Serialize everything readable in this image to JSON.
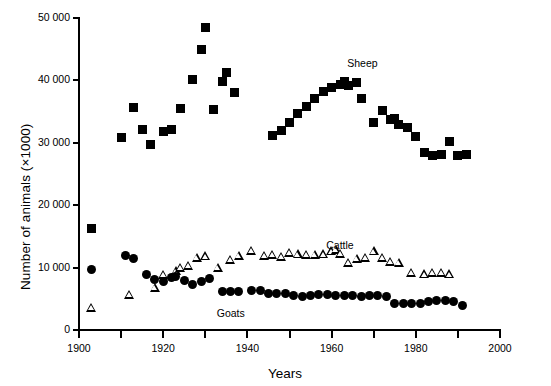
{
  "chart_data": {
    "type": "scatter",
    "title": "",
    "xlabel": "Years",
    "ylabel": "Number of animals (×1000)",
    "xlim": [
      1900,
      2000
    ],
    "ylim": [
      0,
      50000
    ],
    "xticks": [
      1900,
      1910,
      1920,
      1930,
      1940,
      1950,
      1960,
      1970,
      1980,
      1990,
      2000
    ],
    "xticklabels": [
      "1900",
      "1910",
      "1920",
      "1930",
      "1940",
      "1950",
      "1960",
      "1970",
      "1980",
      "1990",
      "2000"
    ],
    "xticklabels_shown": [
      "1900",
      "1920",
      "1940",
      "1960",
      "1980",
      "2000"
    ],
    "yticks": [
      0,
      10000,
      20000,
      30000,
      40000,
      50000
    ],
    "yticklabels": [
      "0",
      "10 000",
      "20 000",
      "30 000",
      "40 000",
      "50 000"
    ],
    "grid": false,
    "legend": "inline-annotations",
    "series": [
      {
        "name": "Sheep",
        "marker": "filled-square",
        "color": "#000000",
        "label_x": 1968,
        "label_y": 42600,
        "points": [
          [
            1903,
            16200
          ],
          [
            1910,
            30800
          ],
          [
            1913,
            35700
          ],
          [
            1915,
            32100
          ],
          [
            1917,
            29800
          ],
          [
            1920,
            31800
          ],
          [
            1922,
            32200
          ],
          [
            1924,
            35500
          ],
          [
            1927,
            40200
          ],
          [
            1929,
            44900
          ],
          [
            1930,
            48500
          ],
          [
            1932,
            35400
          ],
          [
            1934,
            39900
          ],
          [
            1935,
            41300
          ],
          [
            1937,
            38100
          ],
          [
            1946,
            31200
          ],
          [
            1948,
            32000
          ],
          [
            1950,
            33300
          ],
          [
            1952,
            34700
          ],
          [
            1954,
            35800
          ],
          [
            1956,
            37100
          ],
          [
            1958,
            38300
          ],
          [
            1960,
            38900
          ],
          [
            1962,
            39400
          ],
          [
            1963,
            39900
          ],
          [
            1964,
            39200
          ],
          [
            1966,
            39600
          ],
          [
            1967,
            37100
          ],
          [
            1970,
            33300
          ],
          [
            1972,
            35100
          ],
          [
            1974,
            33800
          ],
          [
            1975,
            33900
          ],
          [
            1976,
            32900
          ],
          [
            1978,
            32400
          ],
          [
            1980,
            31000
          ],
          [
            1982,
            28500
          ],
          [
            1984,
            27900
          ],
          [
            1986,
            28100
          ],
          [
            1988,
            30200
          ],
          [
            1990,
            27900
          ],
          [
            1992,
            28200
          ]
        ]
      },
      {
        "name": "Cattle",
        "marker": "open-triangle",
        "color": "#000000",
        "label_x": 1963,
        "label_y": 13400,
        "points": [
          [
            1903,
            3600
          ],
          [
            1912,
            5600
          ],
          [
            1918,
            6700
          ],
          [
            1920,
            8800
          ],
          [
            1923,
            9400
          ],
          [
            1924,
            10000
          ],
          [
            1926,
            10300
          ],
          [
            1928,
            11500
          ],
          [
            1930,
            11800
          ],
          [
            1933,
            10000
          ],
          [
            1936,
            11200
          ],
          [
            1938,
            11900
          ],
          [
            1941,
            12700
          ],
          [
            1944,
            11900
          ],
          [
            1946,
            12000
          ],
          [
            1948,
            11700
          ],
          [
            1950,
            12400
          ],
          [
            1952,
            12100
          ],
          [
            1954,
            12000
          ],
          [
            1956,
            12000
          ],
          [
            1958,
            12100
          ],
          [
            1960,
            12600
          ],
          [
            1961,
            12800
          ],
          [
            1962,
            12200
          ],
          [
            1964,
            10700
          ],
          [
            1966,
            11400
          ],
          [
            1968,
            11500
          ],
          [
            1970,
            12600
          ],
          [
            1972,
            11500
          ],
          [
            1974,
            10900
          ],
          [
            1976,
            10800
          ],
          [
            1979,
            9200
          ],
          [
            1982,
            8900
          ],
          [
            1984,
            9200
          ],
          [
            1986,
            9200
          ],
          [
            1988,
            8900
          ]
        ]
      },
      {
        "name": "Goats",
        "marker": "filled-circle",
        "color": "#000000",
        "label_x": 1937,
        "label_y": 2600,
        "points": [
          [
            1903,
            9700
          ],
          [
            1911,
            11900
          ],
          [
            1913,
            11500
          ],
          [
            1916,
            8900
          ],
          [
            1918,
            8100
          ],
          [
            1920,
            7800
          ],
          [
            1922,
            8400
          ],
          [
            1923,
            8500
          ],
          [
            1925,
            8000
          ],
          [
            1927,
            7300
          ],
          [
            1929,
            7800
          ],
          [
            1931,
            8200
          ],
          [
            1934,
            6200
          ],
          [
            1936,
            6200
          ],
          [
            1938,
            6200
          ],
          [
            1941,
            6300
          ],
          [
            1943,
            6300
          ],
          [
            1945,
            5800
          ],
          [
            1947,
            5900
          ],
          [
            1949,
            5800
          ],
          [
            1951,
            5500
          ],
          [
            1953,
            5400
          ],
          [
            1955,
            5600
          ],
          [
            1957,
            5700
          ],
          [
            1959,
            5700
          ],
          [
            1961,
            5600
          ],
          [
            1963,
            5600
          ],
          [
            1965,
            5500
          ],
          [
            1967,
            5400
          ],
          [
            1969,
            5600
          ],
          [
            1971,
            5500
          ],
          [
            1973,
            5400
          ],
          [
            1975,
            4200
          ],
          [
            1977,
            4200
          ],
          [
            1979,
            4200
          ],
          [
            1981,
            4300
          ],
          [
            1983,
            4500
          ],
          [
            1985,
            4700
          ],
          [
            1987,
            4700
          ],
          [
            1989,
            4500
          ],
          [
            1991,
            4000
          ]
        ]
      }
    ]
  }
}
